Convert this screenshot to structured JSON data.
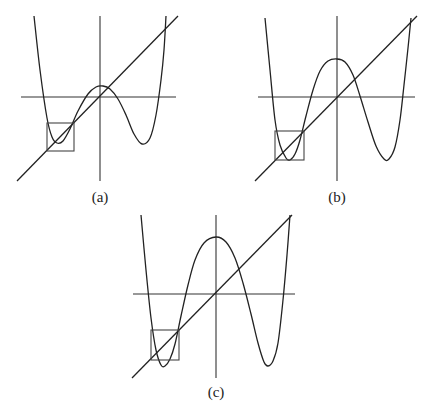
{
  "figure": {
    "panels": [
      {
        "id": "a",
        "label": "(a)",
        "label_pos": [
          100,
          202
        ],
        "v_axis": [
          100,
          16,
          100,
          181
        ],
        "h_axis": [
          21,
          97,
          176,
          97
        ],
        "diagonal": [
          17,
          181,
          178,
          16
        ],
        "box": [
          47,
          123,
          27,
          28
        ],
        "curve_points": [
          [
            34,
            16
          ],
          [
            40,
            70
          ],
          [
            47,
            118
          ],
          [
            52,
            137
          ],
          [
            57,
            143
          ],
          [
            63,
            141
          ],
          [
            70,
            129
          ],
          [
            78,
            111
          ],
          [
            88,
            94
          ],
          [
            96,
            87
          ],
          [
            103,
            86
          ],
          [
            110,
            89
          ],
          [
            118,
            99
          ],
          [
            126,
            115
          ],
          [
            134,
            134
          ],
          [
            142,
            144
          ],
          [
            150,
            138
          ],
          [
            156,
            115
          ],
          [
            161,
            80
          ],
          [
            164,
            50
          ],
          [
            166,
            16
          ]
        ]
      },
      {
        "id": "b",
        "label": "(b)",
        "label_pos": [
          337,
          202
        ],
        "v_axis": [
          337,
          16,
          337,
          181
        ],
        "h_axis": [
          258,
          97,
          415,
          97
        ],
        "diagonal": [
          255,
          181,
          417,
          16
        ],
        "box": [
          275,
          131,
          29,
          29
        ],
        "curve_points": [
          [
            265,
            18
          ],
          [
            270,
            70
          ],
          [
            275,
            120
          ],
          [
            280,
            145
          ],
          [
            286,
            158
          ],
          [
            290,
            160
          ],
          [
            295,
            154
          ],
          [
            300,
            140
          ],
          [
            306,
            116
          ],
          [
            313,
            90
          ],
          [
            320,
            71
          ],
          [
            328,
            61
          ],
          [
            337,
            59
          ],
          [
            345,
            62
          ],
          [
            353,
            75
          ],
          [
            360,
            96
          ],
          [
            368,
            122
          ],
          [
            376,
            146
          ],
          [
            384,
            159
          ],
          [
            389,
            159
          ],
          [
            395,
            147
          ],
          [
            400,
            120
          ],
          [
            404,
            85
          ],
          [
            408,
            48
          ],
          [
            411,
            18
          ]
        ]
      },
      {
        "id": "c",
        "label": "(c)",
        "label_pos": [
          216,
          397
        ],
        "v_axis": [
          216,
          215,
          216,
          378
        ],
        "h_axis": [
          133,
          294,
          295,
          294
        ],
        "diagonal": [
          132,
          378,
          292,
          215
        ],
        "box": [
          151,
          330,
          28,
          30
        ],
        "curve_points": [
          [
            141,
            215
          ],
          [
            146,
            270
          ],
          [
            151,
            318
          ],
          [
            156,
            350
          ],
          [
            161,
            365
          ],
          [
            165,
            366
          ],
          [
            170,
            359
          ],
          [
            175,
            344
          ],
          [
            181,
            316
          ],
          [
            188,
            285
          ],
          [
            195,
            260
          ],
          [
            204,
            243
          ],
          [
            216,
            237
          ],
          [
            226,
            242
          ],
          [
            235,
            258
          ],
          [
            243,
            283
          ],
          [
            251,
            314
          ],
          [
            258,
            343
          ],
          [
            264,
            362
          ],
          [
            268,
            366
          ],
          [
            273,
            361
          ],
          [
            278,
            343
          ],
          [
            283,
            300
          ],
          [
            287,
            255
          ],
          [
            290,
            215
          ]
        ]
      }
    ]
  }
}
